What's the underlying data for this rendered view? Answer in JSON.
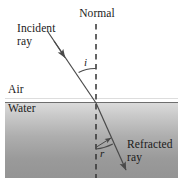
{
  "figure": {
    "title_alt": "Refraction of light at an air-water interface",
    "labels": {
      "incident_ray": "Incident\nray",
      "normal": "Normal",
      "air": "Air",
      "water": "Water",
      "angle_incidence": "i",
      "angle_refraction": "r",
      "refracted_ray": "Refracted\nray"
    },
    "colors": {
      "background": "#ffffff",
      "ink": "#1a1a1a",
      "ray": "#4a4a4a",
      "normal_dash": "#3a3a3a",
      "interface_line": "#6b6b6b",
      "water_top": "#d8d8d8",
      "water_bottom": "#8e8e8e"
    },
    "geometry": {
      "canvas_width": 184,
      "canvas_height": 187,
      "water_rect": {
        "x": 5,
        "y": 102,
        "width": 173,
        "height": 76
      },
      "interface_y": 102,
      "normal_x": 96,
      "normal_top_y": 24,
      "normal_bottom_y": 178,
      "incident_start": {
        "x": 48,
        "y": 32
      },
      "incident_hit": {
        "x": 96,
        "y": 103
      },
      "refracted_end": {
        "x": 128,
        "y": 173
      }
    }
  }
}
